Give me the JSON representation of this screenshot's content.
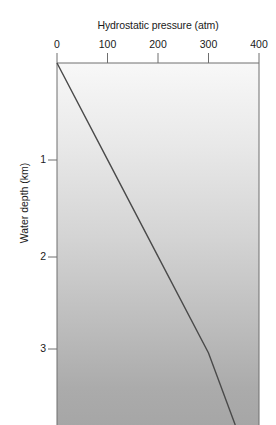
{
  "chart_data": {
    "type": "line",
    "title": "Hydrostatic pressure (atm)",
    "xlabel": "Hydrostatic pressure (atm)",
    "ylabel": "Water depth (km)",
    "xlim": [
      0,
      400
    ],
    "ylim": [
      0,
      3.82
    ],
    "x_axis_position": "top",
    "y_axis_direction": "inverted",
    "grid": false,
    "legend": null,
    "xticks": [
      0,
      100,
      200,
      300,
      400
    ],
    "xtick_labels": [
      "0",
      "100",
      "200",
      "300",
      "400"
    ],
    "yticks": [
      1,
      2,
      3
    ],
    "ytick_labels": [
      "1",
      "2",
      "3"
    ],
    "background": "vertical grayscale gradient, light at surface darkening with depth",
    "series": [
      {
        "name": "Hydrostatic pressure vs water depth",
        "x": [
          0,
          100,
          200,
          300,
          353
        ],
        "y": [
          0,
          1.02,
          2.04,
          3.06,
          3.82
        ],
        "color": "#4a4a4a",
        "linewidth": 1.4
      }
    ],
    "annotations": []
  },
  "colors": {
    "axis": "#6e6e6e",
    "text": "#1a1a1a",
    "line": "#4a4a4a",
    "gradient_top": "#f8f8f8",
    "gradient_bottom": "#a6a6a6"
  }
}
